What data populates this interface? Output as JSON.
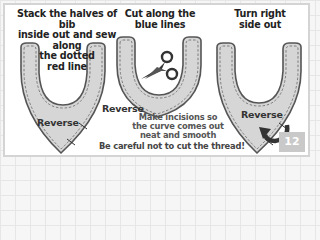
{
  "steps": [
    {
      "caption_lines": [
        "Stack the halves of bib",
        "inside out and sew along",
        "the dotted",
        "red line"
      ],
      "label": "Reverse"
    },
    {
      "caption_lines": [
        "Cut along the",
        "blue lines"
      ],
      "label": "Reverse",
      "note_lines": [
        "Make incisions so",
        "the curve comes out",
        "neat and smooth"
      ],
      "warning": "Be careful not to cut the thread!"
    },
    {
      "caption_lines": [
        "Turn right",
        "side out"
      ],
      "label": "Reverse"
    }
  ],
  "icons": {
    "step2": "scissors-icon",
    "step3": "curved-arrow-icon"
  },
  "page_number": "12",
  "colors": {
    "bib_fill": "#d6d6d6",
    "bib_outline": "#555555",
    "stitch": "#666666",
    "text": "#222222",
    "badge_bg": "#c9c9c9",
    "panel_border": "#d4d4d4"
  }
}
